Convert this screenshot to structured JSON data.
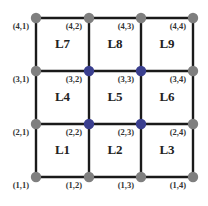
{
  "diagram": {
    "title": "",
    "grid": {
      "rows": 4,
      "cols": 4
    },
    "colors": {
      "edge": "#1a1a1a",
      "boundary_node": "#7f7f7f",
      "interior_node": "#3a3f8f"
    },
    "nodes": [
      {
        "label": "(1,1)",
        "row": 1,
        "col": 1,
        "type": "boundary"
      },
      {
        "label": "(1,2)",
        "row": 1,
        "col": 2,
        "type": "boundary"
      },
      {
        "label": "(1,3)",
        "row": 1,
        "col": 3,
        "type": "boundary"
      },
      {
        "label": "(1,4)",
        "row": 1,
        "col": 4,
        "type": "boundary"
      },
      {
        "label": "(2,1)",
        "row": 2,
        "col": 1,
        "type": "boundary"
      },
      {
        "label": "(2,2)",
        "row": 2,
        "col": 2,
        "type": "interior"
      },
      {
        "label": "(2,3)",
        "row": 2,
        "col": 3,
        "type": "interior"
      },
      {
        "label": "(2,4)",
        "row": 2,
        "col": 4,
        "type": "boundary"
      },
      {
        "label": "(3,1)",
        "row": 3,
        "col": 1,
        "type": "boundary"
      },
      {
        "label": "(3,2)",
        "row": 3,
        "col": 2,
        "type": "interior"
      },
      {
        "label": "(3,3)",
        "row": 3,
        "col": 3,
        "type": "interior"
      },
      {
        "label": "(3,4)",
        "row": 3,
        "col": 4,
        "type": "boundary"
      },
      {
        "label": "(4,1)",
        "row": 4,
        "col": 1,
        "type": "boundary"
      },
      {
        "label": "(4,2)",
        "row": 4,
        "col": 2,
        "type": "boundary"
      },
      {
        "label": "(4,3)",
        "row": 4,
        "col": 3,
        "type": "boundary"
      },
      {
        "label": "(4,4)",
        "row": 4,
        "col": 4,
        "type": "boundary"
      }
    ],
    "cells": [
      {
        "label": "L1",
        "row": 1,
        "col": 1
      },
      {
        "label": "L2",
        "row": 1,
        "col": 2
      },
      {
        "label": "L3",
        "row": 1,
        "col": 3
      },
      {
        "label": "L4",
        "row": 2,
        "col": 1
      },
      {
        "label": "L5",
        "row": 2,
        "col": 2
      },
      {
        "label": "L6",
        "row": 2,
        "col": 3
      },
      {
        "label": "L7",
        "row": 3,
        "col": 1
      },
      {
        "label": "L8",
        "row": 3,
        "col": 2
      },
      {
        "label": "L9",
        "row": 3,
        "col": 3
      }
    ]
  }
}
